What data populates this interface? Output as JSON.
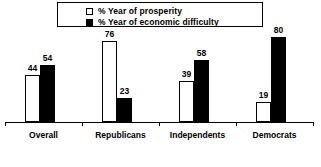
{
  "chart_data": {
    "type": "bar",
    "title": "",
    "subtitle": "",
    "xlabel": "",
    "ylabel": "",
    "ylim": [
      0,
      80
    ],
    "grid": false,
    "legend_position": "top",
    "categories": [
      "Overall",
      "Republicans",
      "Independents",
      "Democrats"
    ],
    "series": [
      {
        "name": "% Year of prosperity",
        "swatch": "hollow",
        "color": "#ffffff",
        "values": [
          44,
          76,
          39,
          19
        ]
      },
      {
        "name": "% Year of economic difficulty",
        "swatch": "filled",
        "color": "#000000",
        "values": [
          54,
          23,
          58,
          80
        ]
      }
    ]
  },
  "legend": {
    "items": [
      {
        "label": "% Year of prosperity",
        "swatch": "hollow"
      },
      {
        "label": "% Year of economic difficulty",
        "swatch": "filled"
      }
    ]
  },
  "axis": {
    "baseline_color": "#000000"
  }
}
